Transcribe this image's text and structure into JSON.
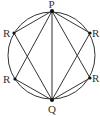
{
  "diagram": {
    "type": "inscribed-circle-geometry",
    "colors": {
      "stroke": "#333333",
      "background": "#ffffff",
      "point": "#111111"
    },
    "circle": {
      "cx": 51.5,
      "cy": 55.5,
      "r": 43.5
    },
    "points": {
      "P": {
        "label": "P",
        "x": 52,
        "y": 11
      },
      "Q": {
        "label": "Q",
        "x": 52,
        "y": 100
      },
      "R1": {
        "label": "R",
        "x": 14,
        "y": 33
      },
      "R2": {
        "label": "R",
        "x": 90,
        "y": 33
      },
      "R3": {
        "label": "R",
        "x": 15,
        "y": 79
      },
      "R4": {
        "label": "R",
        "x": 90,
        "y": 78
      }
    },
    "labels": {
      "P": "P",
      "Q": "Q",
      "R_upper_left": "R",
      "R_upper_right": "R",
      "R_lower_left": "R",
      "R_lower_right": "R"
    },
    "segments": [
      [
        "P",
        "Q"
      ],
      [
        "P",
        "R1"
      ],
      [
        "P",
        "R2"
      ],
      [
        "P",
        "R3"
      ],
      [
        "P",
        "R4"
      ],
      [
        "Q",
        "R1"
      ],
      [
        "Q",
        "R2"
      ],
      [
        "Q",
        "R3"
      ],
      [
        "Q",
        "R4"
      ]
    ]
  }
}
